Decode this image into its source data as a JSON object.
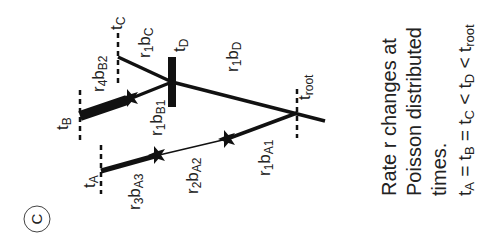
{
  "panel": {
    "label": "C"
  },
  "times": {
    "tA": {
      "main": "t",
      "sub": "A"
    },
    "tB": {
      "main": "t",
      "sub": "B"
    },
    "tC": {
      "main": "t",
      "sub": "C"
    },
    "tD": {
      "main": "t",
      "sub": "D"
    },
    "troot": {
      "main": "t",
      "sub": "root"
    }
  },
  "branches": {
    "r4bB2": {
      "r": "r",
      "rsub": "4",
      "b": "b",
      "bsub": "B2"
    },
    "r1bB1": {
      "r": "r",
      "rsub": "1",
      "b": "b",
      "bsub": "B1"
    },
    "r1bC": {
      "r": "r",
      "rsub": "1",
      "b": "b",
      "bsub": "C"
    },
    "r1bD": {
      "r": "r",
      "rsub": "1",
      "b": "b",
      "bsub": "D"
    },
    "r3bA3": {
      "r": "r",
      "rsub": "3",
      "b": "b",
      "bsub": "A3"
    },
    "r2bA2": {
      "r": "r",
      "rsub": "2",
      "b": "b",
      "bsub": "A2"
    },
    "r1bA1": {
      "r": "r",
      "rsub": "1",
      "b": "b",
      "bsub": "A1"
    }
  },
  "caption": {
    "line1": "Rate r changes at",
    "line2": "Poisson distributed",
    "line3": "times.",
    "eq": {
      "t1": "t",
      "s1": "A",
      "op1": " = ",
      "t2": "t",
      "s2": "B",
      "op2": " = ",
      "t3": "t",
      "s3": "C",
      "op3": " < ",
      "t4": "t",
      "s4": "D",
      "op4": " < ",
      "t5": "t",
      "s5": "root"
    }
  },
  "colors": {
    "ink": "#111111",
    "text": "#222222",
    "background": "#ffffff"
  }
}
